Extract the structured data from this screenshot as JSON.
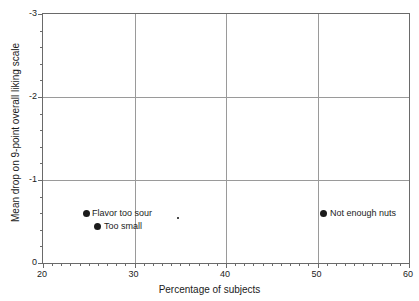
{
  "chart_data": {
    "type": "scatter",
    "title": "",
    "xlabel": "Percentage of subjects",
    "ylabel": "Mean drop on 9-point overall liking scale",
    "xlim": [
      20,
      60
    ],
    "ylim": [
      0,
      -3
    ],
    "y_axis_inverted": true,
    "grid": true,
    "legend": null,
    "x_ticks_major": [
      20,
      30,
      40,
      50,
      60
    ],
    "x_tick_labels": [
      "20",
      "30",
      "40",
      "50",
      "60"
    ],
    "x_minor_tick_step": 1,
    "y_ticks_major": [
      0,
      -1,
      -2,
      -3
    ],
    "y_tick_labels": [
      "0",
      "-1",
      "-2",
      "-3"
    ],
    "y_minor_tick_step": 0.2,
    "gridlines_x": [
      30,
      40,
      50
    ],
    "gridlines_y": [
      -1,
      -2
    ],
    "points": [
      {
        "label": "Flavor too sour",
        "x": 24.7,
        "y": -0.6,
        "marker": "large",
        "label_position": "right"
      },
      {
        "label": "Too small",
        "x": 26.0,
        "y": -0.44,
        "marker": "large",
        "label_position": "right"
      },
      {
        "label": "Not enough nuts",
        "x": 50.7,
        "y": -0.6,
        "marker": "large",
        "label_position": "right"
      },
      {
        "label": "",
        "x": 34.8,
        "y": -0.54,
        "marker": "tiny",
        "label_position": "none"
      }
    ],
    "colors": {
      "marker": "#1b1b1b",
      "gridline": "#9a9a9a",
      "axis": "#6a6a6a",
      "text": "#1b1b1b",
      "background": "#ffffff"
    }
  }
}
